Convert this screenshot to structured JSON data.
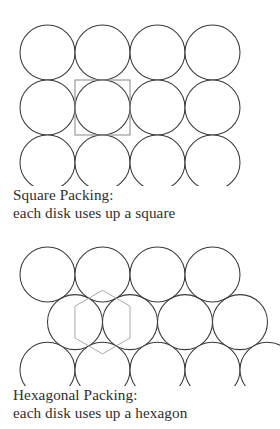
{
  "page": {
    "background_color": "#ffffff",
    "text_color": "#2e2e2e",
    "disk_stroke_color": "#3a3a3a",
    "square_cell_color": "#8d8d8d",
    "hexagon_cell_color": "#a9a9a9"
  },
  "square_packing": {
    "caption_line1": "Square Packing:",
    "caption_line2": "each disk uses up a square",
    "rows": 3,
    "columns": 4,
    "disk_radius": 27.5,
    "disk_diameter": 55,
    "row_spacing": 55,
    "column_spacing": 55,
    "origin_x": 20,
    "origin_y": 25,
    "highlight_cell": {
      "shape": "square",
      "center_x": 102.5,
      "center_y": 107.5,
      "side": 55
    }
  },
  "hexagonal_packing": {
    "caption_line1": "Hexagonal Packing:",
    "caption_line2": "each disk uses up a hexagon",
    "disk_radius": 27.5,
    "disk_diameter": 55,
    "row_spacing": 47.6,
    "rows": [
      {
        "count": 4,
        "offset_x": 0,
        "origin_y": 25
      },
      {
        "count": 4,
        "offset_x": 27.5,
        "origin_y": 72.6
      },
      {
        "count": 5,
        "offset_x": 0,
        "origin_y": 120.2
      }
    ],
    "origin_x": 20,
    "highlight_cell": {
      "shape": "hexagon",
      "center_x": 102.5,
      "center_y": 100.1,
      "circumradius": 31.8,
      "orientation": "pointy-top"
    }
  }
}
